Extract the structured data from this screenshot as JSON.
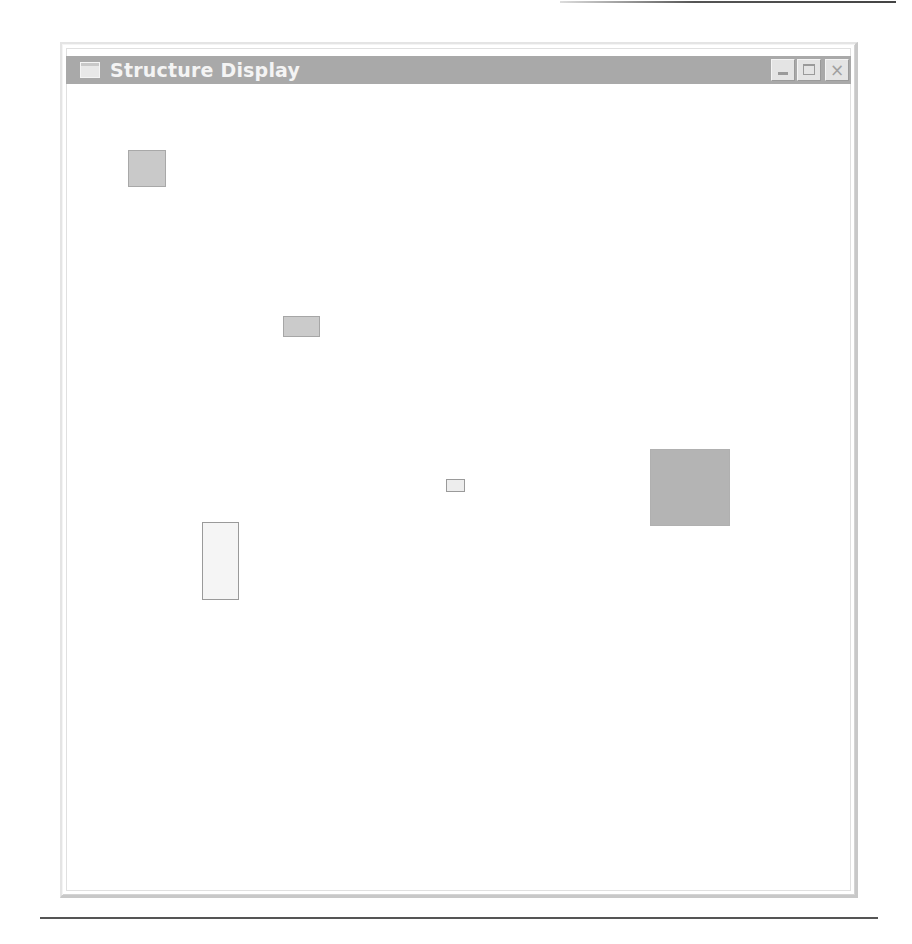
{
  "window": {
    "title": "Structure Display",
    "controls": {
      "minimize": "minimize",
      "maximize": "maximize",
      "close": "×"
    }
  },
  "colors": {
    "titlebar": "#a9a9a9",
    "title_text": "#f4f4f4",
    "shape_border": "#9a9a9a"
  },
  "shapes": [
    {
      "id": "block-1",
      "x": 128,
      "y": 150,
      "w": 38,
      "h": 37,
      "fill": "#c9c9c9",
      "border": "#a8a8a8"
    },
    {
      "id": "block-2",
      "x": 283,
      "y": 316,
      "w": 37,
      "h": 21,
      "fill": "#cbcbcb",
      "border": "#a6a6a6"
    },
    {
      "id": "block-3",
      "x": 446,
      "y": 479,
      "w": 19,
      "h": 13,
      "fill": "#ededed",
      "border": "#9a9a9a"
    },
    {
      "id": "block-4",
      "x": 650,
      "y": 449,
      "w": 80,
      "h": 77,
      "fill": "#b4b4b4",
      "border": "#b0b0b0"
    },
    {
      "id": "block-5",
      "x": 202,
      "y": 522,
      "w": 37,
      "h": 78,
      "fill": "#f5f5f5",
      "border": "#9a9a9a"
    }
  ]
}
